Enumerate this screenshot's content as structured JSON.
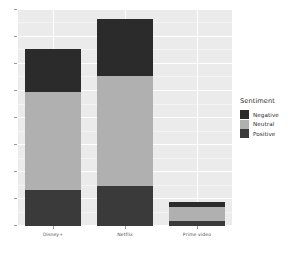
{
  "chart_data": {
    "type": "bar",
    "stacked": true,
    "orientation": "vertical",
    "title": "",
    "subtitle": "",
    "xlabel": "",
    "ylabel": "",
    "categories": [
      "Disney+",
      "Netflix",
      "Prime video"
    ],
    "series": [
      {
        "name": "Negative",
        "color": "#2b2b2b",
        "values": [
          2400,
          3150,
          260
        ]
      },
      {
        "name": "Neutral",
        "color": "#b0b0b0",
        "values": [
          5400,
          6100,
          800
        ]
      },
      {
        "name": "Positive",
        "color": "#3a3a3a",
        "values": [
          2000,
          2200,
          250
        ]
      }
    ],
    "bar_totals": [
      9800,
      11450,
      1310
    ],
    "ylim": [
      0,
      12000
    ],
    "y_gridlines": [
      0,
      1500,
      3000,
      4500,
      6000,
      7500,
      9000,
      10500,
      12000
    ],
    "y_ticklabels": [],
    "grid": true,
    "panel_background": "#ebebeb",
    "gridline_color": "#ffffff",
    "legend": {
      "title": "Sentiment",
      "position": "right",
      "entries": [
        {
          "label": "Negative",
          "color": "#2b2b2b"
        },
        {
          "label": "Neutral",
          "color": "#b0b0b0"
        },
        {
          "label": "Positive",
          "color": "#3a3a3a"
        }
      ]
    }
  },
  "axis": {
    "x_tick_labels": [
      "Disney+",
      "Netflix",
      "Prime video"
    ]
  },
  "legend": {
    "title": "Sentiment",
    "items": [
      {
        "label": "Negative"
      },
      {
        "label": "Neutral"
      },
      {
        "label": "Positive"
      }
    ]
  }
}
